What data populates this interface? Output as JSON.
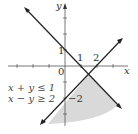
{
  "diagram": {
    "axes": {
      "x_label": "x",
      "y_label": "y",
      "origin_label": "0",
      "x_tick_labels": [
        "1",
        "2"
      ],
      "y_tick_labels": [
        "1",
        "−2"
      ]
    },
    "lines": [
      {
        "equation": "x + y = 1",
        "color": "#222222"
      },
      {
        "equation": "x − y = 2",
        "color": "#222222"
      }
    ],
    "inequalities": [
      "x + y ≤ 1",
      "x − y ≥ 2"
    ],
    "shade_color": "#d9d9d9",
    "intersection": {
      "x": 1.5,
      "y": -0.5
    }
  }
}
